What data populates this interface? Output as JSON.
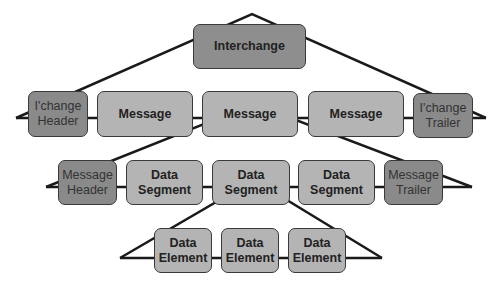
{
  "diagram": {
    "level1": {
      "interchange": "Interchange"
    },
    "level2": {
      "header": "I'change\nHeader",
      "message1": "Message",
      "message2": "Message",
      "message3": "Message",
      "trailer": "I'change\nTrailer"
    },
    "level3": {
      "header": "Message\nHeader",
      "segment1": "Data\nSegment",
      "segment2": "Data\nSegment",
      "segment3": "Data\nSegment",
      "trailer": "Message\nTrailer"
    },
    "level4": {
      "element1": "Data\nElement",
      "element2": "Data\nElement",
      "element3": "Data\nElement"
    },
    "colors": {
      "light_box": "#b4b4b4",
      "dark_box": "#8a8a8a",
      "line": "#1a1a1a"
    }
  }
}
